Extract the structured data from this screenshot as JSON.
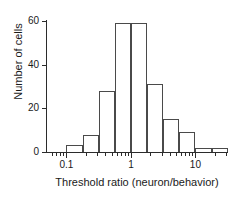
{
  "chart_data": {
    "type": "bar",
    "title": "",
    "subtitle": "",
    "xlabel": "Threshold ratio (neuron/behavior)",
    "ylabel": "Number of cells",
    "xscale": "log",
    "xlim": [
      0.05,
      32
    ],
    "ylim": [
      0,
      60
    ],
    "yticks": [
      0,
      20,
      40,
      60
    ],
    "ytick_labels": [
      "0",
      "20",
      "40",
      "60"
    ],
    "xticks_major": [
      0.1,
      1,
      10
    ],
    "xtick_labels": [
      "0.1",
      "1",
      "10"
    ],
    "xticks_minor": [
      0.06,
      0.07,
      0.08,
      0.09,
      0.2,
      0.3,
      0.4,
      0.5,
      0.6,
      0.7,
      0.8,
      0.9,
      2,
      3,
      4,
      5,
      6,
      7,
      8,
      9,
      20,
      30
    ],
    "grid": false,
    "legend": false,
    "bin_edges": [
      0.056,
      0.1,
      0.178,
      0.316,
      0.562,
      1.0,
      1.778,
      3.162,
      5.623,
      10.0,
      17.78,
      31.62
    ],
    "categories": [
      "0.056-0.1",
      "0.1-0.178",
      "0.178-0.316",
      "0.316-0.562",
      "0.562-1.0",
      "1.0-1.778",
      "1.778-3.162",
      "3.162-5.623",
      "5.623-10.0",
      "10.0-17.78",
      "17.78-31.62"
    ],
    "values": [
      0,
      3,
      8,
      28,
      59,
      59,
      31,
      15,
      9,
      2,
      2
    ],
    "bar_fill": "none",
    "bar_edge_color": "#4a4a4a",
    "axis_color": "#2b2b2b",
    "background": "#ffffff"
  }
}
